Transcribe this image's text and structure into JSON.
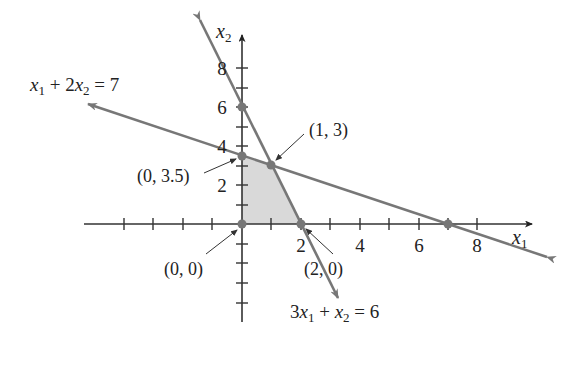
{
  "diagram": {
    "axes": {
      "x_label": "x",
      "x_sub": "1",
      "y_label": "x",
      "y_sub": "2",
      "x_ticks": [
        {
          "label": "2"
        },
        {
          "label": "4"
        },
        {
          "label": "6"
        },
        {
          "label": "8"
        }
      ],
      "y_ticks": [
        {
          "label": "2"
        },
        {
          "label": "4"
        },
        {
          "label": "6"
        },
        {
          "label": "8"
        }
      ]
    },
    "lines": [
      {
        "equation_parts": [
          "x",
          "1",
          " + 2",
          "x",
          "2",
          " = 7"
        ],
        "equation": "x1 + 2x2 = 7"
      },
      {
        "equation_parts": [
          "3",
          "x",
          "1",
          " + ",
          "x",
          "2",
          " = 6"
        ],
        "equation": "3x1 + x2 = 6"
      }
    ],
    "points": [
      {
        "label": "(0, 3.5)"
      },
      {
        "label": "(1, 3)"
      },
      {
        "label": "(0, 0)"
      },
      {
        "label": "(2, 0)"
      }
    ],
    "colors": {
      "line": "#777777",
      "axis": "#333333",
      "feasible_region": "#d9d9d9",
      "point": "#777777"
    }
  }
}
